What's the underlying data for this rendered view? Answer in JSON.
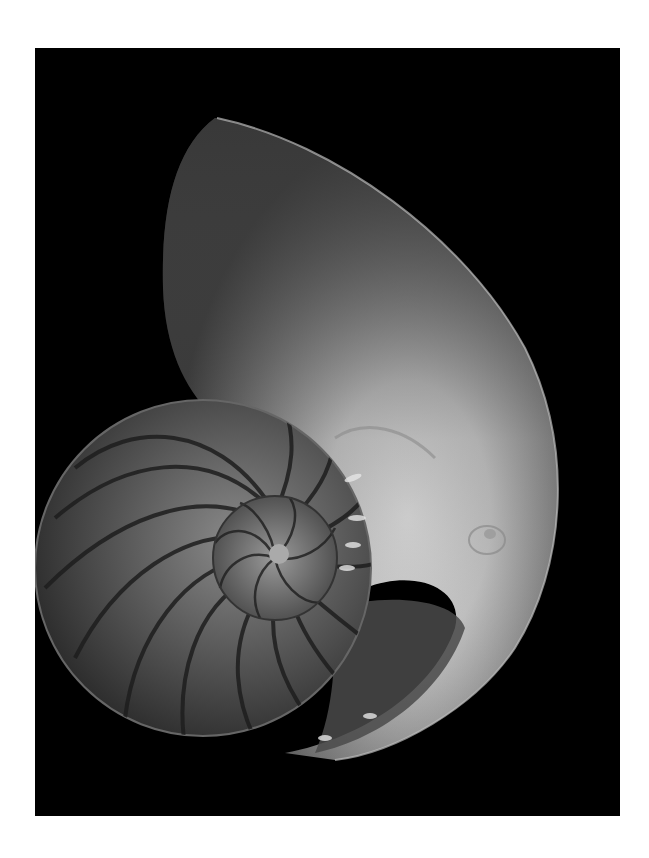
{
  "page": {
    "background": "#ffffff"
  },
  "photo": {
    "subject": "nautilus-shell-cross-section",
    "style": "black-and-white",
    "backdrop_color": "#000000",
    "frame": {
      "left": 35,
      "top": 48,
      "width": 585,
      "height": 768
    }
  }
}
